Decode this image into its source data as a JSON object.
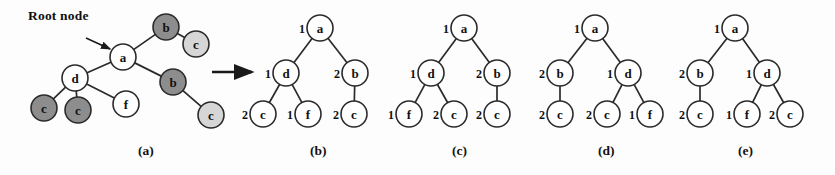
{
  "figure": {
    "width": 835,
    "height": 175,
    "annotations": [
      {
        "name": "root-node-annotation",
        "text": "Root node",
        "x": 28,
        "y": 8
      }
    ],
    "captions": [
      {
        "name": "caption-a",
        "text": "(a)",
        "x": 138,
        "y": 143
      },
      {
        "name": "caption-b",
        "text": "(b)",
        "x": 310,
        "y": 143
      },
      {
        "name": "caption-c",
        "text": "(c)",
        "x": 452,
        "y": 143
      },
      {
        "name": "caption-d",
        "text": "(d)",
        "x": 598,
        "y": 143
      },
      {
        "name": "caption-e",
        "text": "(e)",
        "x": 738,
        "y": 143
      }
    ],
    "pointer_arrow": {
      "name": "root-node-pointer-arrow",
      "x1": 86,
      "y1": 38,
      "x2": 110,
      "y2": 49
    },
    "transform_arrow": {
      "name": "transform-arrow",
      "x1": 212,
      "y1": 72,
      "x2": 252,
      "y2": 72
    },
    "colors": {
      "stroke": "#2b2b2b",
      "node_fill": "#ffffff",
      "shade_dark": "#8d8d8d",
      "shade_light": "#d6d6d6",
      "text": "#111111",
      "background": "#fdfdfd"
    }
  },
  "panels": [
    {
      "id": "a",
      "name": "panel-a",
      "radius": 13,
      "nodes": [
        {
          "id": "a",
          "label": "a",
          "x": 123,
          "y": 57,
          "shade": "none"
        },
        {
          "id": "b1",
          "label": "b",
          "x": 166,
          "y": 27,
          "shade": "dark"
        },
        {
          "id": "c1",
          "label": "c",
          "x": 196,
          "y": 44,
          "shade": "light"
        },
        {
          "id": "b2",
          "label": "b",
          "x": 173,
          "y": 82,
          "shade": "dark"
        },
        {
          "id": "c2",
          "label": "c",
          "x": 211,
          "y": 115,
          "shade": "light"
        },
        {
          "id": "d",
          "label": "d",
          "x": 75,
          "y": 78,
          "shade": "none"
        },
        {
          "id": "c3",
          "label": "c",
          "x": 44,
          "y": 108,
          "shade": "dark"
        },
        {
          "id": "c4",
          "label": "c",
          "x": 78,
          "y": 110,
          "shade": "dark"
        },
        {
          "id": "f",
          "label": "f",
          "x": 126,
          "y": 104,
          "shade": "none"
        }
      ],
      "edges": [
        {
          "from": "a",
          "to": "b1"
        },
        {
          "from": "b1",
          "to": "c1"
        },
        {
          "from": "a",
          "to": "b2"
        },
        {
          "from": "b2",
          "to": "c2"
        },
        {
          "from": "a",
          "to": "d"
        },
        {
          "from": "d",
          "to": "c3"
        },
        {
          "from": "d",
          "to": "c4"
        },
        {
          "from": "d",
          "to": "f"
        }
      ],
      "weights": []
    },
    {
      "id": "b",
      "name": "panel-b",
      "radius": 13,
      "nodes": [
        {
          "id": "a",
          "label": "a",
          "x": 320,
          "y": 28,
          "shade": "none"
        },
        {
          "id": "d",
          "label": "d",
          "x": 286,
          "y": 73,
          "shade": "none"
        },
        {
          "id": "b",
          "label": "b",
          "x": 355,
          "y": 73,
          "shade": "none"
        },
        {
          "id": "c1",
          "label": "c",
          "x": 263,
          "y": 114,
          "shade": "none"
        },
        {
          "id": "f",
          "label": "f",
          "x": 308,
          "y": 114,
          "shade": "none"
        },
        {
          "id": "c2",
          "label": "c",
          "x": 354,
          "y": 114,
          "shade": "none"
        }
      ],
      "edges": [
        {
          "from": "a",
          "to": "d"
        },
        {
          "from": "a",
          "to": "b"
        },
        {
          "from": "d",
          "to": "c1"
        },
        {
          "from": "d",
          "to": "f"
        },
        {
          "from": "b",
          "to": "c2"
        }
      ],
      "weights": [
        {
          "node": "a",
          "text": "1",
          "x": 302,
          "y": 28
        },
        {
          "node": "d",
          "text": "1",
          "x": 268,
          "y": 73
        },
        {
          "node": "b",
          "text": "2",
          "x": 337,
          "y": 73
        },
        {
          "node": "c1",
          "text": "2",
          "x": 245,
          "y": 114
        },
        {
          "node": "f",
          "text": "1",
          "x": 290,
          "y": 114
        },
        {
          "node": "c2",
          "text": "2",
          "x": 336,
          "y": 114
        }
      ]
    },
    {
      "id": "c",
      "name": "panel-c",
      "radius": 13,
      "nodes": [
        {
          "id": "a",
          "label": "a",
          "x": 464,
          "y": 28,
          "shade": "none"
        },
        {
          "id": "d",
          "label": "d",
          "x": 431,
          "y": 73,
          "shade": "none"
        },
        {
          "id": "b",
          "label": "b",
          "x": 497,
          "y": 73,
          "shade": "none"
        },
        {
          "id": "f",
          "label": "f",
          "x": 409,
          "y": 114,
          "shade": "none"
        },
        {
          "id": "c1",
          "label": "c",
          "x": 454,
          "y": 114,
          "shade": "none"
        },
        {
          "id": "c2",
          "label": "c",
          "x": 497,
          "y": 114,
          "shade": "none"
        }
      ],
      "edges": [
        {
          "from": "a",
          "to": "d"
        },
        {
          "from": "a",
          "to": "b"
        },
        {
          "from": "d",
          "to": "f"
        },
        {
          "from": "d",
          "to": "c1"
        },
        {
          "from": "b",
          "to": "c2"
        }
      ],
      "weights": [
        {
          "node": "a",
          "text": "1",
          "x": 446,
          "y": 28
        },
        {
          "node": "d",
          "text": "1",
          "x": 413,
          "y": 73
        },
        {
          "node": "b",
          "text": "2",
          "x": 479,
          "y": 73
        },
        {
          "node": "f",
          "text": "1",
          "x": 391,
          "y": 114
        },
        {
          "node": "c1",
          "text": "2",
          "x": 436,
          "y": 114
        },
        {
          "node": "c2",
          "text": "2",
          "x": 479,
          "y": 114
        }
      ]
    },
    {
      "id": "d",
      "name": "panel-d",
      "radius": 13,
      "nodes": [
        {
          "id": "a",
          "label": "a",
          "x": 595,
          "y": 28,
          "shade": "none"
        },
        {
          "id": "b",
          "label": "b",
          "x": 560,
          "y": 73,
          "shade": "none"
        },
        {
          "id": "d",
          "label": "d",
          "x": 628,
          "y": 73,
          "shade": "none"
        },
        {
          "id": "c1",
          "label": "c",
          "x": 560,
          "y": 114,
          "shade": "none"
        },
        {
          "id": "c2",
          "label": "c",
          "x": 607,
          "y": 114,
          "shade": "none"
        },
        {
          "id": "f",
          "label": "f",
          "x": 650,
          "y": 114,
          "shade": "none"
        }
      ],
      "edges": [
        {
          "from": "a",
          "to": "b"
        },
        {
          "from": "a",
          "to": "d"
        },
        {
          "from": "b",
          "to": "c1"
        },
        {
          "from": "d",
          "to": "c2"
        },
        {
          "from": "d",
          "to": "f"
        }
      ],
      "weights": [
        {
          "node": "a",
          "text": "1",
          "x": 577,
          "y": 28
        },
        {
          "node": "b",
          "text": "2",
          "x": 542,
          "y": 73
        },
        {
          "node": "d",
          "text": "1",
          "x": 610,
          "y": 73
        },
        {
          "node": "c1",
          "text": "2",
          "x": 542,
          "y": 114
        },
        {
          "node": "c2",
          "text": "2",
          "x": 589,
          "y": 114
        },
        {
          "node": "f",
          "text": "1",
          "x": 632,
          "y": 114
        }
      ]
    },
    {
      "id": "e",
      "name": "panel-e",
      "radius": 13,
      "nodes": [
        {
          "id": "a",
          "label": "a",
          "x": 735,
          "y": 28,
          "shade": "none"
        },
        {
          "id": "b",
          "label": "b",
          "x": 700,
          "y": 73,
          "shade": "none"
        },
        {
          "id": "d",
          "label": "d",
          "x": 767,
          "y": 73,
          "shade": "none"
        },
        {
          "id": "c1",
          "label": "c",
          "x": 700,
          "y": 114,
          "shade": "none"
        },
        {
          "id": "f",
          "label": "f",
          "x": 747,
          "y": 114,
          "shade": "none"
        },
        {
          "id": "c2",
          "label": "c",
          "x": 790,
          "y": 114,
          "shade": "none"
        }
      ],
      "edges": [
        {
          "from": "a",
          "to": "b"
        },
        {
          "from": "a",
          "to": "d"
        },
        {
          "from": "b",
          "to": "c1"
        },
        {
          "from": "d",
          "to": "f"
        },
        {
          "from": "d",
          "to": "c2"
        }
      ],
      "weights": [
        {
          "node": "a",
          "text": "1",
          "x": 717,
          "y": 28
        },
        {
          "node": "b",
          "text": "2",
          "x": 682,
          "y": 73
        },
        {
          "node": "d",
          "text": "1",
          "x": 749,
          "y": 73
        },
        {
          "node": "c1",
          "text": "2",
          "x": 682,
          "y": 114
        },
        {
          "node": "f",
          "text": "1",
          "x": 729,
          "y": 114
        },
        {
          "node": "c2",
          "text": "2",
          "x": 772,
          "y": 114
        }
      ]
    }
  ]
}
